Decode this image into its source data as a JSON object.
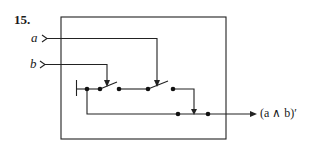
{
  "problem": {
    "number": "15."
  },
  "inputs": [
    {
      "id": "a",
      "label": "a"
    },
    {
      "id": "b",
      "label": "b"
    }
  ],
  "output": {
    "label": "(a ∧ b)′"
  },
  "circuit": {
    "type": "switching circuit",
    "components": [
      "ground",
      "switch-b",
      "switch-a",
      "output-arrow"
    ],
    "description": "Two switches in series controlled by a and b; output is (a ∧ b)′"
  },
  "colors": {
    "line": "#222222",
    "background": "#ffffff"
  }
}
